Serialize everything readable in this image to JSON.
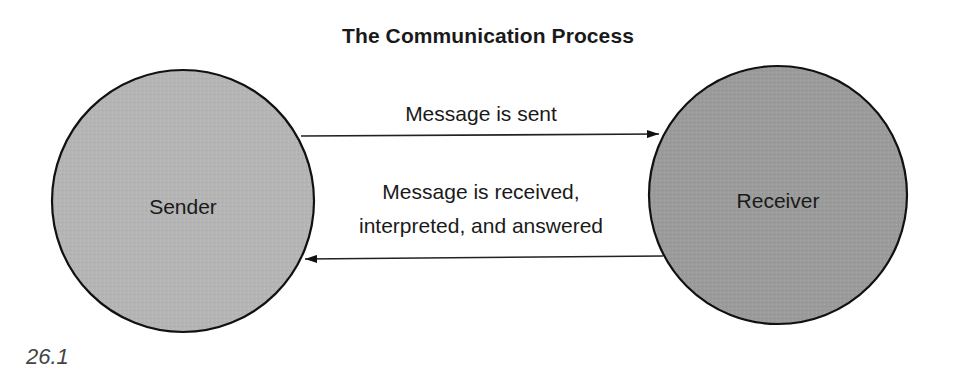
{
  "title": "The Communication Process",
  "nodes": {
    "sender": {
      "label": "Sender",
      "fill": "#b4b4b4"
    },
    "receiver": {
      "label": "Receiver",
      "fill": "#9a9a9a"
    }
  },
  "edges": {
    "sent": {
      "label": "Message is sent",
      "from": "Sender",
      "to": "Receiver"
    },
    "returned": {
      "label_line1": "Message is received,",
      "label_line2": "interpreted, and answered",
      "from": "Receiver",
      "to": "Sender"
    }
  },
  "figure_number": "26.1",
  "colors": {
    "stroke": "#111111",
    "text": "#1a1a1a",
    "background": "#ffffff"
  }
}
